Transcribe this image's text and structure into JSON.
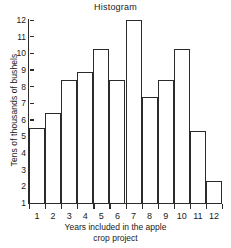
{
  "chart_data": {
    "type": "bar",
    "title": "Histogram",
    "xlabel": "Years included in the apple crop project",
    "xlabel_line1": "Years included in the apple",
    "xlabel_line2": "crop project",
    "ylabel": "Tens of thousands of bushels",
    "categories": [
      "1",
      "2",
      "3",
      "4",
      "5",
      "6",
      "7",
      "8",
      "9",
      "10",
      "11",
      "12"
    ],
    "values": [
      5.5,
      6.4,
      8.4,
      8.85,
      10.25,
      8.4,
      12.0,
      7.4,
      8.4,
      10.25,
      5.3,
      2.3
    ],
    "ylim": [
      1,
      12
    ],
    "yticks": [
      "12",
      "11",
      "10",
      "9",
      "8",
      "7",
      "6",
      "5",
      "4",
      "3",
      "2",
      "1"
    ],
    "ytick_values": [
      12,
      11,
      10,
      9,
      8,
      7,
      6,
      5,
      4,
      3,
      2,
      1
    ],
    "grid": false,
    "legend": "none",
    "bar_fill": "#ffffff",
    "bar_stroke": "#2b2b2b",
    "background": "#ffffff",
    "text_color": "#1a1a1a"
  }
}
